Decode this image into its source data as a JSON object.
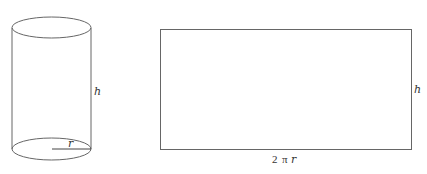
{
  "figure": {
    "stroke_color": "#666666",
    "background": "#ffffff",
    "cylinder": {
      "height_label": "h",
      "radius_label": "r"
    },
    "rectangle": {
      "height_label": "h",
      "width_label_number": "2",
      "width_label_pi": "π",
      "width_label_var": "r"
    }
  }
}
